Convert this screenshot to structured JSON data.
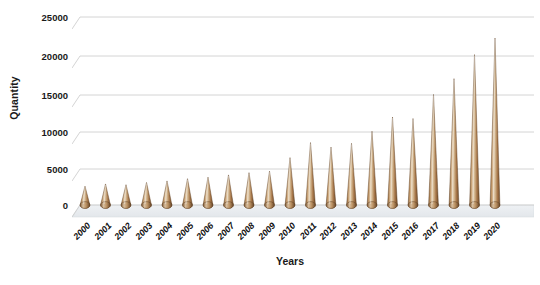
{
  "chart_data": {
    "type": "bar",
    "subtype": "3d-cone",
    "title": "",
    "xlabel": "Years",
    "ylabel": "Quantity",
    "categories": [
      "2000",
      "2001",
      "2002",
      "2003",
      "2004",
      "2005",
      "2006",
      "2007",
      "2008",
      "2009",
      "2010",
      "2011",
      "2012",
      "2013",
      "2014",
      "2015",
      "2016",
      "2017",
      "2018",
      "2019",
      "2020"
    ],
    "values": [
      2500,
      2800,
      2700,
      3000,
      3200,
      3500,
      3700,
      4000,
      4300,
      4500,
      6300,
      8300,
      7700,
      8200,
      9800,
      11700,
      11500,
      14700,
      16800,
      20000,
      22200
    ],
    "ylim": [
      0,
      25000
    ],
    "ytick_labels": [
      "0",
      "5000",
      "10000",
      "15000",
      "20000",
      "25000"
    ],
    "ytick_values": [
      0,
      5000,
      10000,
      15000,
      20000,
      25000
    ],
    "grid": true,
    "grid_color": "#c8c8c8",
    "legend": null,
    "series_color": "#b68a58",
    "series_color_light": "#e8d2b4",
    "series_color_dark": "#6b4a2a",
    "background": "#ffffff",
    "floor_color": "#e9ecef"
  }
}
